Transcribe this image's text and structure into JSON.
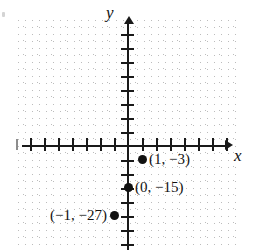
{
  "figure": {
    "kind": "coordinate-plane-scatter",
    "background_color": "#ffffff",
    "ink_color": "#111111",
    "grid_color": "#c9c9c9"
  },
  "axes": {
    "x_axis_label": "x",
    "y_axis_label": "y",
    "x_ticks_left_of_origin": 7,
    "x_ticks_right_of_origin": 7,
    "y_ticks_above_origin": 8,
    "y_ticks_below_origin": 7,
    "tick_spacing_px": 14,
    "grid": "dotted",
    "tick_labels_shown": false
  },
  "chart_data": {
    "type": "scatter",
    "title": "",
    "xlabel": "x",
    "ylabel": "y",
    "grid": true,
    "legend": "none",
    "xlim": [
      -7,
      7
    ],
    "ylim": [
      -7,
      8
    ],
    "x": [
      1,
      0,
      -1
    ],
    "y": [
      -3,
      -15,
      -27
    ],
    "point_labels": [
      "(1, −3)",
      "(0, −15)",
      "(−1, −27)"
    ],
    "points": [
      {
        "label": "(1, −3)",
        "x": 1,
        "y": -3,
        "plot_x": 1,
        "plot_y": -1
      },
      {
        "label": "(0, −15)",
        "x": 0,
        "y": -15,
        "plot_x": 0,
        "plot_y": -3
      },
      {
        "label": "(−1, −27)",
        "x": -1,
        "y": -27,
        "plot_x": -1,
        "plot_y": -5
      }
    ]
  }
}
